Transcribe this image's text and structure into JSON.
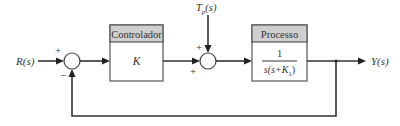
{
  "diagram": {
    "type": "block-diagram",
    "title": "",
    "input": {
      "label": "R(s)"
    },
    "output": {
      "label": "Y(s)"
    },
    "disturbance": {
      "label": "T_p(s)",
      "main": "T",
      "sub": "p",
      "suffix": "(s)"
    },
    "summing_junctions": [
      {
        "id": "sum1",
        "signs": {
          "left": "+",
          "bottom": "−"
        }
      },
      {
        "id": "sum2",
        "signs": {
          "top": "+",
          "left": "+"
        }
      }
    ],
    "blocks": [
      {
        "id": "controller",
        "header": "Controlador",
        "body": "K"
      },
      {
        "id": "process",
        "header": "Processo",
        "numerator": "1",
        "denominator": "s(s+K₁)",
        "denominator_parts": {
          "pre": "s(s+K",
          "sub": "1",
          "post": ")"
        }
      }
    ],
    "connections": [
      {
        "from": "R(s)",
        "to": "sum1",
        "sign": "+"
      },
      {
        "from": "sum1",
        "to": "controller"
      },
      {
        "from": "controller",
        "to": "sum2",
        "sign": "+"
      },
      {
        "from": "T_p(s)",
        "to": "sum2",
        "sign": "+"
      },
      {
        "from": "sum2",
        "to": "process"
      },
      {
        "from": "process",
        "to": "Y(s)"
      },
      {
        "from": "Y(s)",
        "to": "sum1",
        "sign": "−",
        "type": "unity-feedback"
      }
    ]
  }
}
